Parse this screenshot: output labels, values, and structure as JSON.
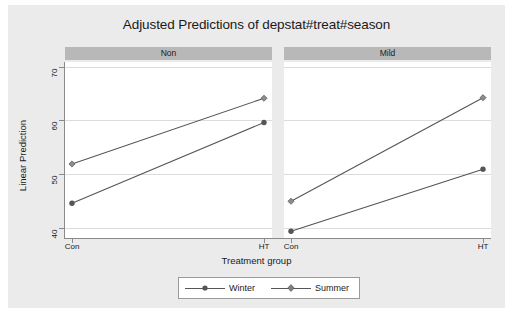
{
  "chart_data": {
    "type": "line",
    "title": "Adjusted Predictions of depstat#treat#season",
    "xlabel": "Treatment group",
    "ylabel": "Linear Prediction",
    "categories": [
      "Con",
      "HT"
    ],
    "ylim": [
      37.5,
      71.5
    ],
    "yticks": [
      40,
      50,
      60,
      70
    ],
    "ytick_labels": [
      "40",
      "50",
      "60",
      "70"
    ],
    "grid": true,
    "legend_position": "bottom",
    "panels": [
      {
        "label": "Non",
        "series": [
          {
            "name": "Winter",
            "marker": "circle",
            "values": [
              44.2,
              59.8
            ]
          },
          {
            "name": "Summer",
            "marker": "diamond",
            "values": [
              51.8,
              64.5
            ]
          }
        ]
      },
      {
        "label": "Mild",
        "series": [
          {
            "name": "Winter",
            "marker": "circle",
            "values": [
              38.8,
              50.8
            ]
          },
          {
            "name": "Summer",
            "marker": "diamond",
            "values": [
              44.6,
              64.6
            ]
          }
        ]
      }
    ],
    "legend": [
      {
        "name": "Winter",
        "marker": "circle"
      },
      {
        "name": "Summer",
        "marker": "diamond"
      }
    ],
    "colors": {
      "line": "#555555",
      "marker": "#555555",
      "grid": "#dcdcdc",
      "axis": "#8a8a8a",
      "panel_header_bg": "#b8b8b8",
      "plot_bg": "#ffffff",
      "graph_bg": "#ebebeb"
    }
  }
}
